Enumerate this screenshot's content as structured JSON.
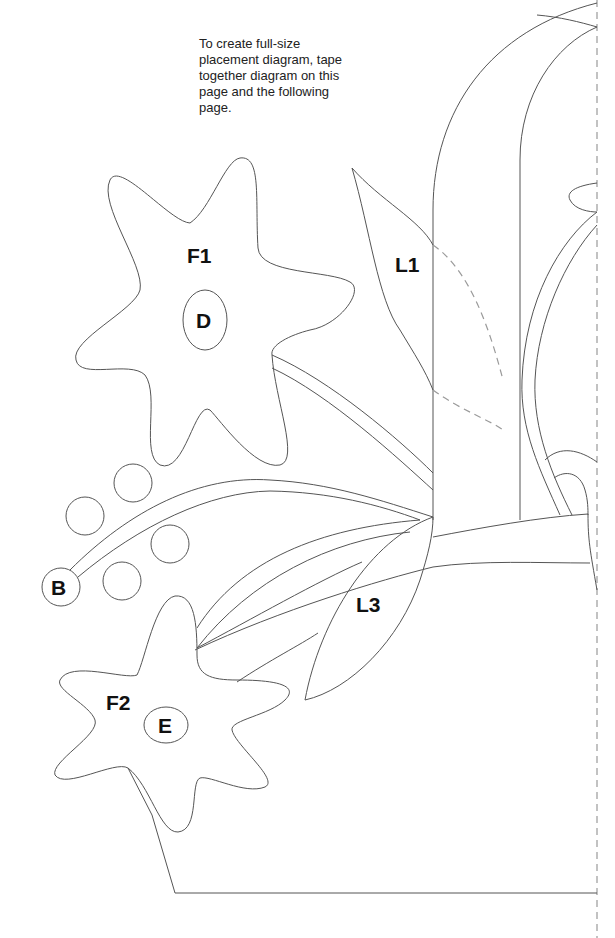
{
  "instruction_note": "To create full-size placement diagram, tape together diagram on this page and the following page.",
  "labels": {
    "f1": "F1",
    "d": "D",
    "l1": "L1",
    "b": "B",
    "l3": "L3",
    "f2": "F2",
    "e": "E"
  },
  "colors": {
    "outline": "#555555",
    "dashed_guide": "#9a9a9a",
    "label_text": "#111111",
    "background": "#ffffff"
  }
}
